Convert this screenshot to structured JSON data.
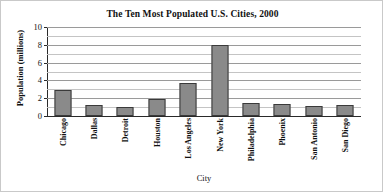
{
  "chart_data": {
    "type": "bar",
    "title": "The Ten Most Populated U.S. Cities, 2000",
    "xlabel": "City",
    "ylabel": "Population (millions)",
    "categories": [
      "Chicago",
      "Dallas",
      "Detroit",
      "Houston",
      "Los Angeles",
      "New York",
      "Philadelphia",
      "Phoenix",
      "San Antonio",
      "San Diego"
    ],
    "values": [
      2.9,
      1.2,
      1.0,
      1.9,
      3.7,
      8.0,
      1.5,
      1.3,
      1.1,
      1.2
    ],
    "ylim": [
      0,
      10
    ],
    "ytick_labels": [
      "0",
      "2",
      "4",
      "6",
      "8",
      "10"
    ],
    "ytick_values": [
      0,
      2,
      4,
      6,
      8,
      10
    ],
    "minor_gridline_values": [
      1,
      3,
      5,
      7,
      9
    ],
    "grid": true,
    "grid_axis": "y",
    "legend": false,
    "bar_color": "#8a8a8a",
    "bar_edge_color": "#3a3a3a",
    "gridline_color": "#c4c4c4",
    "axis_color": "#2a2a2a",
    "background_color": "#ffffff"
  }
}
